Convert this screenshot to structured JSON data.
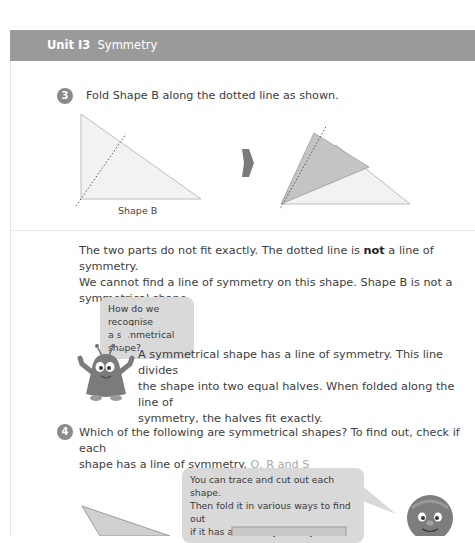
{
  "header": {
    "unit_label": "Unit I3",
    "unit_title": "Symmetry",
    "bar_color": "#9a9a9a"
  },
  "question3": {
    "number": "3",
    "prompt": "Fold Shape B along the dotted line as shown.",
    "figure_left_caption": "Shape B",
    "explanation_pre": "The two parts do not fit exactly. The dotted line is ",
    "explanation_bold": "not",
    "explanation_post": " a line of symmetry. We cannot find a line of symmetry on this shape. Shape B is not a symmetrical shape.",
    "line1_pre": "The two parts do not fit exactly. The dotted line is ",
    "line1_bold": "not",
    "line1_post": " a line of symmetry.",
    "line2": "We cannot find a line of symmetry on this shape. Shape B is not a",
    "line3": "symmetrical shape.",
    "mascot_bubble_line1": "How do we recognise",
    "mascot_bubble_line2": "a symmetrical shape?",
    "definition_line1": "A symmetrical shape has a line of symmetry. This line divides",
    "definition_line2": "the shape into two equal halves. When folded along the line of",
    "definition_line3": "symmetry, the halves fit exactly."
  },
  "question4": {
    "number": "4",
    "prompt_line1": "Which of the following are symmetrical shapes? To find out, check if each",
    "prompt_line2": "shape has a line of symmetry.",
    "answer": "Q, R and S",
    "tip_line1": "You can trace and cut out each shape.",
    "tip_line2": "Then fold it in various ways to find out",
    "tip_line3": "if it has a line of symmetry."
  },
  "icons": {
    "arrow": "right-arrow-icon",
    "mascot_monster": "monster-mascot-icon",
    "mascot_ball": "ball-mascot-icon"
  }
}
